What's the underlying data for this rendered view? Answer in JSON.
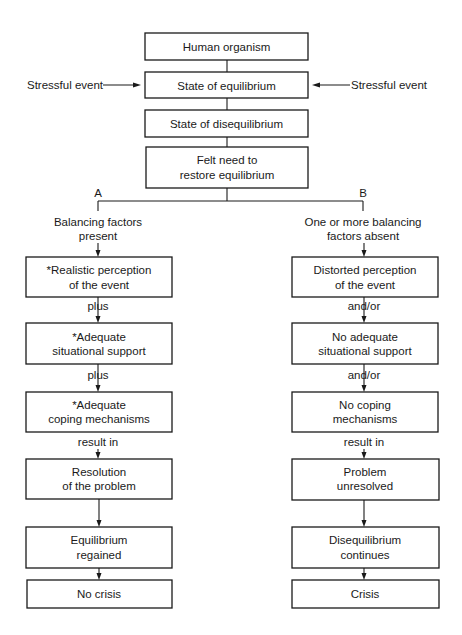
{
  "diagram": {
    "type": "flowchart",
    "center_column": [
      {
        "id": "human-organism",
        "lines": [
          "Human organism"
        ]
      },
      {
        "id": "state-of-equilibrium",
        "lines": [
          "State of equilibrium"
        ]
      },
      {
        "id": "state-of-disequilibrium",
        "lines": [
          "State of disequilibrium"
        ]
      },
      {
        "id": "felt-need",
        "lines": [
          "Felt need to",
          "restore equilibrium"
        ]
      }
    ],
    "side_inputs": {
      "left": "Stressful event",
      "right": "Stressful event"
    },
    "branches": {
      "a": {
        "letter": "A",
        "heading": [
          "Balancing factors",
          "present"
        ],
        "boxes": [
          {
            "id": "realistic-perception",
            "lines": [
              "*Realistic perception",
              "of the event"
            ]
          },
          {
            "id": "adequate-support",
            "lines": [
              "*Adequate",
              "situational support"
            ]
          },
          {
            "id": "adequate-coping",
            "lines": [
              "*Adequate",
              "coping mechanisms"
            ]
          },
          {
            "id": "resolution",
            "lines": [
              "Resolution",
              "of the problem"
            ]
          },
          {
            "id": "equilibrium-regained",
            "lines": [
              "Equilibrium",
              "regained"
            ]
          },
          {
            "id": "no-crisis",
            "lines": [
              "No crisis"
            ]
          }
        ],
        "connectors": [
          "plus",
          "plus",
          "result in",
          "",
          ""
        ]
      },
      "b": {
        "letter": "B",
        "heading": [
          "One or more balancing",
          "factors absent"
        ],
        "boxes": [
          {
            "id": "distorted-perception",
            "lines": [
              "Distorted perception",
              "of the event"
            ]
          },
          {
            "id": "no-adequate-support",
            "lines": [
              "No adequate",
              "situational support"
            ]
          },
          {
            "id": "no-coping",
            "lines": [
              "No coping",
              "mechanisms"
            ]
          },
          {
            "id": "problem-unresolved",
            "lines": [
              "Problem",
              "unresolved"
            ]
          },
          {
            "id": "disequilibrium-continues",
            "lines": [
              "Disequilibrium",
              "continues"
            ]
          },
          {
            "id": "crisis",
            "lines": [
              "Crisis"
            ]
          }
        ],
        "connectors": [
          "and/or",
          "and/or",
          "result in",
          "",
          ""
        ]
      }
    }
  }
}
